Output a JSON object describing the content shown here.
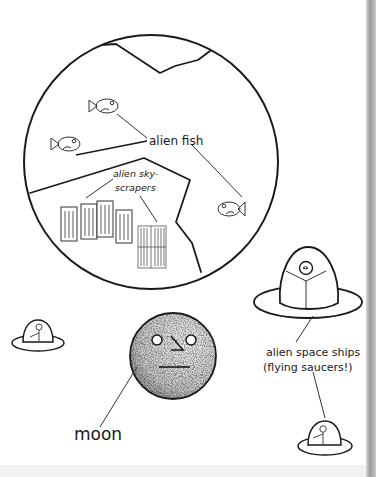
{
  "labels": {
    "alien_fish": "alien fish",
    "skyscrapers_line1": "alien sky-",
    "skyscrapers_line2": "scrapers",
    "space_ships_line1": "alien space ships",
    "space_ships_line2": "(flying saucers!)",
    "moon": "moon"
  },
  "colors": {
    "ink": "#1a1a1a",
    "background": "#ffffff",
    "edge": "#9a9a9a"
  },
  "icons": [
    "planet-circle",
    "fish-icon",
    "skyscraper-icon",
    "moon-icon",
    "flying-saucer-icon"
  ]
}
